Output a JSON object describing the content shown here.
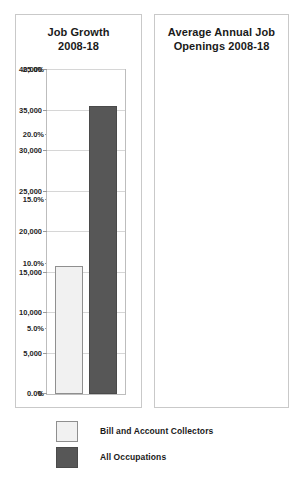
{
  "chart_data": [
    {
      "type": "bar",
      "title": "Job Growth 2008-18",
      "title_line1": "Job Growth",
      "title_line2": "2008-18",
      "categories": [
        "Bill and Account Collectors",
        "All Occupations"
      ],
      "values": [
        19.3,
        10.4
      ],
      "value_labels": [
        "19.3%",
        "10.4%"
      ],
      "xlabel": "",
      "ylabel": "",
      "ylim": [
        0,
        25
      ],
      "ytick_labels": [
        "0.0%",
        "5.0%",
        "10.0%",
        "15.0%",
        "20.0%",
        "25.0%"
      ],
      "ytick_values": [
        0,
        5,
        10,
        15,
        20,
        25
      ],
      "grid": true,
      "legend_position": "bottom"
    },
    {
      "type": "bar",
      "title": "Average Annual Job Openings 2008-18",
      "title_line1": "Average Annual Job",
      "title_line2": "Openings 2008-18",
      "categories": [
        "Bill and Account Collectors",
        "All Occupations"
      ],
      "values": [
        15800,
        35600
      ],
      "value_labels": [
        "15,800",
        "35,600"
      ],
      "xlabel": "",
      "ylabel": "",
      "ylim": [
        0,
        40000
      ],
      "ytick_labels": [
        "0",
        "5,000",
        "10,000",
        "15,000",
        "20,000",
        "25,000",
        "30,000",
        "35,000",
        "40,000"
      ],
      "ytick_values": [
        0,
        5000,
        10000,
        15000,
        20000,
        25000,
        30000,
        35000,
        40000
      ],
      "grid": true,
      "legend_position": "bottom"
    }
  ],
  "legend": {
    "items": [
      {
        "label": "Bill and Account Collectors",
        "color": "#f1f1f1",
        "border": "#8f8f8f"
      },
      {
        "label": "All Occupations",
        "color": "#575757",
        "border": "#4a4a4a"
      }
    ]
  },
  "colors": {
    "series_light_fill": "#f1f1f1",
    "series_light_border": "#8f8f8f",
    "series_dark_fill": "#575757",
    "series_dark_border": "#4a4a4a",
    "gridline": "#d6d6d6",
    "panel_border": "#c9c9c9",
    "text": "#1a1a1a",
    "background": "#ffffff"
  }
}
